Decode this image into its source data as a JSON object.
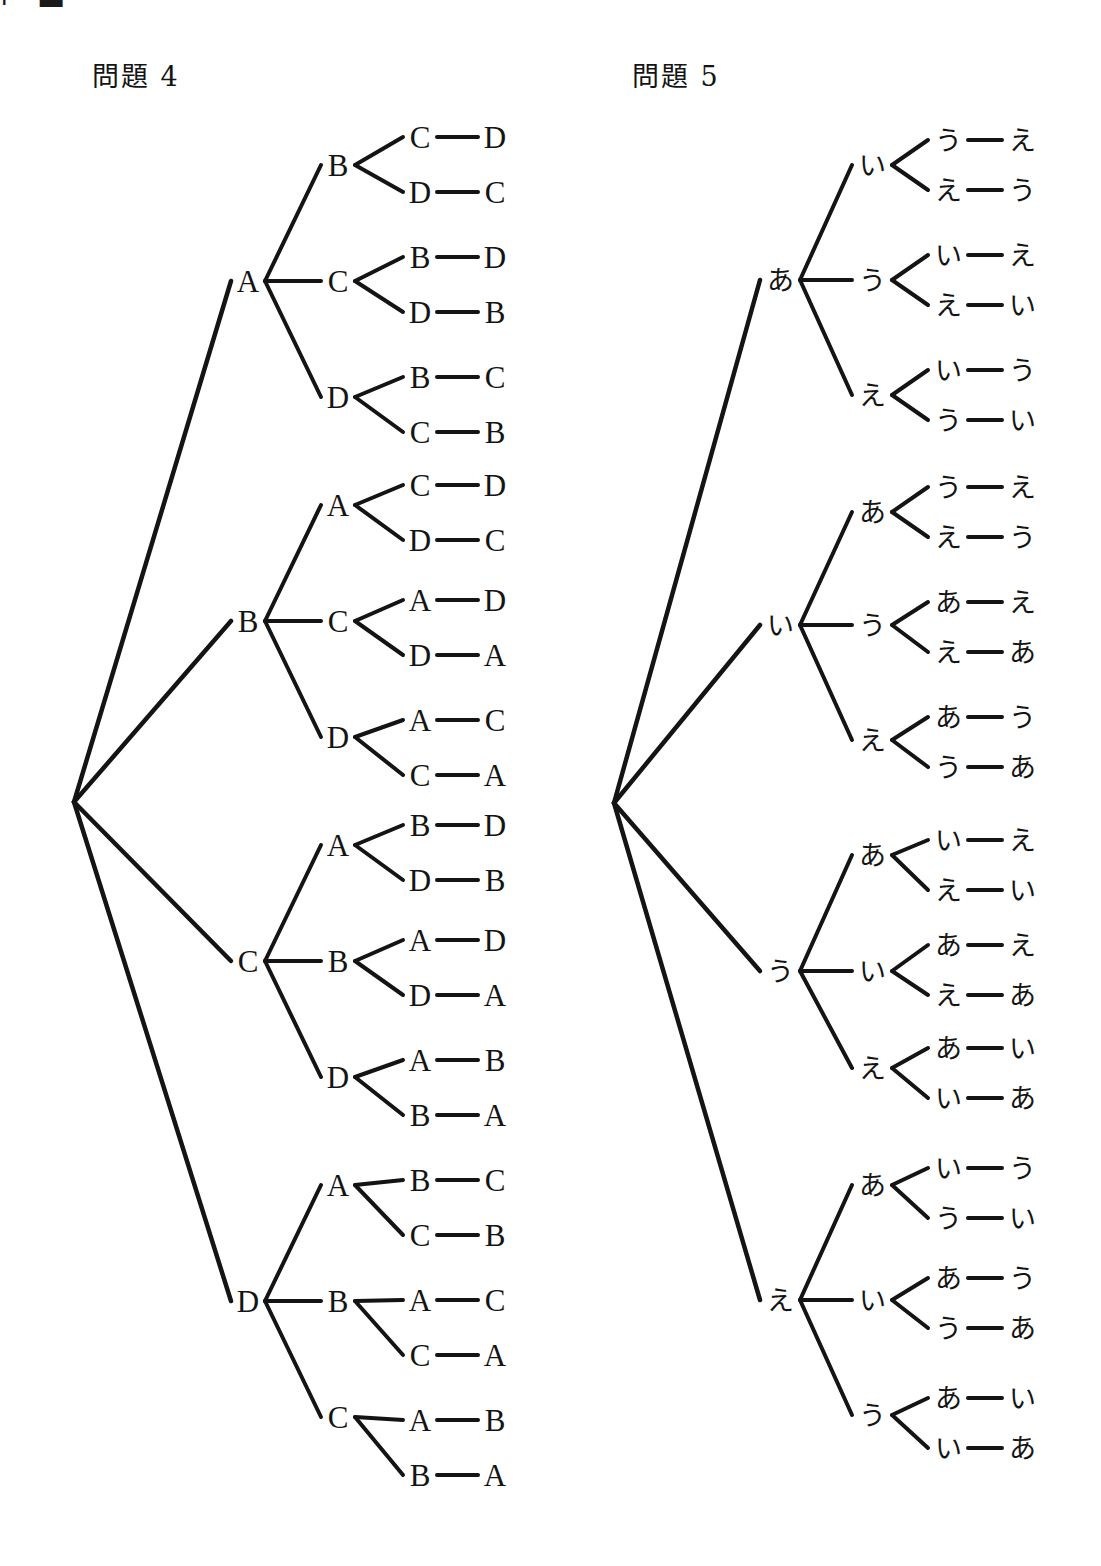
{
  "page": {
    "corner_mark": "⌐ ▬",
    "background_color": "#ffffff",
    "ink_color": "#141414"
  },
  "sections": [
    {
      "id": "problem-4",
      "title": "問題 4",
      "title_x": 92,
      "title_y": 62,
      "script": "latin",
      "root": {
        "x": 68,
        "y": 802
      },
      "columns": {
        "level1": 248,
        "level2": 338,
        "level3": 420,
        "level4": 495
      },
      "items": [
        "A",
        "B",
        "C",
        "D"
      ],
      "groups": [
        {
          "level1": "A",
          "level1_y": 281,
          "branches": [
            {
              "level2": "B",
              "level2_y": 165,
              "leaves": [
                {
                  "third": "C",
                  "fourth": "D",
                  "y": 137
                },
                {
                  "third": "D",
                  "fourth": "C",
                  "y": 192
                }
              ]
            },
            {
              "level2": "C",
              "level2_y": 281,
              "leaves": [
                {
                  "third": "B",
                  "fourth": "D",
                  "y": 257
                },
                {
                  "third": "D",
                  "fourth": "B",
                  "y": 312
                }
              ]
            },
            {
              "level2": "D",
              "level2_y": 397,
              "leaves": [
                {
                  "third": "B",
                  "fourth": "C",
                  "y": 377
                },
                {
                  "third": "C",
                  "fourth": "B",
                  "y": 432
                }
              ]
            }
          ]
        },
        {
          "level1": "B",
          "level1_y": 621,
          "branches": [
            {
              "level2": "A",
              "level2_y": 505,
              "leaves": [
                {
                  "third": "C",
                  "fourth": "D",
                  "y": 485
                },
                {
                  "third": "D",
                  "fourth": "C",
                  "y": 540
                }
              ]
            },
            {
              "level2": "C",
              "level2_y": 621,
              "leaves": [
                {
                  "third": "A",
                  "fourth": "D",
                  "y": 600
                },
                {
                  "third": "D",
                  "fourth": "A",
                  "y": 655
                }
              ]
            },
            {
              "level2": "D",
              "level2_y": 737,
              "leaves": [
                {
                  "third": "A",
                  "fourth": "C",
                  "y": 720
                },
                {
                  "third": "C",
                  "fourth": "A",
                  "y": 775
                }
              ]
            }
          ]
        },
        {
          "level1": "C",
          "level1_y": 961,
          "branches": [
            {
              "level2": "A",
              "level2_y": 845,
              "leaves": [
                {
                  "third": "B",
                  "fourth": "D",
                  "y": 825
                },
                {
                  "third": "D",
                  "fourth": "B",
                  "y": 880
                }
              ]
            },
            {
              "level2": "B",
              "level2_y": 961,
              "leaves": [
                {
                  "third": "A",
                  "fourth": "D",
                  "y": 940
                },
                {
                  "third": "D",
                  "fourth": "A",
                  "y": 995
                }
              ]
            },
            {
              "level2": "D",
              "level2_y": 1077,
              "leaves": [
                {
                  "third": "A",
                  "fourth": "B",
                  "y": 1060
                },
                {
                  "third": "B",
                  "fourth": "A",
                  "y": 1115
                }
              ]
            }
          ]
        },
        {
          "level1": "D",
          "level1_y": 1301,
          "branches": [
            {
              "level2": "A",
              "level2_y": 1185,
              "leaves": [
                {
                  "third": "B",
                  "fourth": "C",
                  "y": 1180
                },
                {
                  "third": "C",
                  "fourth": "B",
                  "y": 1235
                }
              ]
            },
            {
              "level2": "B",
              "level2_y": 1301,
              "leaves": [
                {
                  "third": "A",
                  "fourth": "C",
                  "y": 1300
                },
                {
                  "third": "C",
                  "fourth": "A",
                  "y": 1355
                }
              ]
            },
            {
              "level2": "C",
              "level2_y": 1417,
              "leaves": [
                {
                  "third": "A",
                  "fourth": "B",
                  "y": 1420
                },
                {
                  "third": "B",
                  "fourth": "A",
                  "y": 1475
                }
              ]
            }
          ]
        }
      ]
    },
    {
      "id": "problem-5",
      "title": "問題 5",
      "title_x": 632,
      "title_y": 62,
      "script": "kana",
      "root": {
        "x": 608,
        "y": 803
      },
      "columns": {
        "level1": 780,
        "level2": 872,
        "level3": 948,
        "level4": 1022
      },
      "items": [
        "あ",
        "い",
        "う",
        "え"
      ],
      "groups": [
        {
          "level1": "あ",
          "level1_y": 280,
          "branches": [
            {
              "level2": "い",
              "level2_y": 165,
              "leaves": [
                {
                  "third": "う",
                  "fourth": "え",
                  "y": 140
                },
                {
                  "third": "え",
                  "fourth": "う",
                  "y": 190
                }
              ]
            },
            {
              "level2": "う",
              "level2_y": 280,
              "leaves": [
                {
                  "third": "い",
                  "fourth": "え",
                  "y": 255
                },
                {
                  "third": "え",
                  "fourth": "い",
                  "y": 305
                }
              ]
            },
            {
              "level2": "え",
              "level2_y": 395,
              "leaves": [
                {
                  "third": "い",
                  "fourth": "う",
                  "y": 370
                },
                {
                  "third": "う",
                  "fourth": "い",
                  "y": 420
                }
              ]
            }
          ]
        },
        {
          "level1": "い",
          "level1_y": 625,
          "branches": [
            {
              "level2": "あ",
              "level2_y": 512,
              "leaves": [
                {
                  "third": "う",
                  "fourth": "え",
                  "y": 487
                },
                {
                  "third": "え",
                  "fourth": "う",
                  "y": 537
                }
              ]
            },
            {
              "level2": "う",
              "level2_y": 625,
              "leaves": [
                {
                  "third": "あ",
                  "fourth": "え",
                  "y": 602
                },
                {
                  "third": "え",
                  "fourth": "あ",
                  "y": 652
                }
              ]
            },
            {
              "level2": "え",
              "level2_y": 740,
              "leaves": [
                {
                  "third": "あ",
                  "fourth": "う",
                  "y": 717
                },
                {
                  "third": "う",
                  "fourth": "あ",
                  "y": 767
                }
              ]
            }
          ]
        },
        {
          "level1": "う",
          "level1_y": 971,
          "branches": [
            {
              "level2": "あ",
              "level2_y": 855,
              "leaves": [
                {
                  "third": "い",
                  "fourth": "え",
                  "y": 840
                },
                {
                  "third": "え",
                  "fourth": "い",
                  "y": 890
                }
              ]
            },
            {
              "level2": "い",
              "level2_y": 971,
              "leaves": [
                {
                  "third": "あ",
                  "fourth": "え",
                  "y": 945
                },
                {
                  "third": "え",
                  "fourth": "あ",
                  "y": 995
                }
              ]
            },
            {
              "level2": "え",
              "level2_y": 1068,
              "leaves": [
                {
                  "third": "あ",
                  "fourth": "い",
                  "y": 1048
                },
                {
                  "third": "い",
                  "fourth": "あ",
                  "y": 1098
                }
              ]
            }
          ]
        },
        {
          "level1": "え",
          "level1_y": 1300,
          "branches": [
            {
              "level2": "あ",
              "level2_y": 1185,
              "leaves": [
                {
                  "third": "い",
                  "fourth": "う",
                  "y": 1168
                },
                {
                  "third": "う",
                  "fourth": "い",
                  "y": 1218
                }
              ]
            },
            {
              "level2": "い",
              "level2_y": 1300,
              "leaves": [
                {
                  "third": "あ",
                  "fourth": "う",
                  "y": 1278
                },
                {
                  "third": "う",
                  "fourth": "あ",
                  "y": 1328
                }
              ]
            },
            {
              "level2": "う",
              "level2_y": 1415,
              "leaves": [
                {
                  "third": "あ",
                  "fourth": "い",
                  "y": 1398
                },
                {
                  "third": "い",
                  "fourth": "あ",
                  "y": 1448
                }
              ]
            }
          ]
        }
      ]
    }
  ]
}
